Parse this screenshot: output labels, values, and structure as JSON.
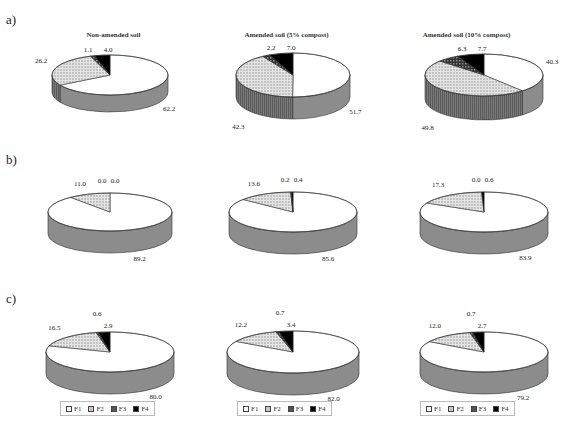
{
  "chart_data": {
    "type": "pie",
    "subtype": "3d-pie-grid",
    "legend": [
      "F1",
      "F2",
      "F3",
      "F4"
    ],
    "legend_position": "bottom (row c only)",
    "colors": {
      "F1": "#ffffff",
      "F2": "#c8c8c8",
      "F3": "#555555",
      "F4": "#000000",
      "side": "#8a8a8a"
    },
    "rows": [
      {
        "label": "a)",
        "charts": [
          {
            "title": "Non-amended soil",
            "values": {
              "F1": 62.2,
              "F2": 26.2,
              "F3": 1.1,
              "F4": 4.0
            }
          },
          {
            "title": "Amended soil (5% compost)",
            "values": {
              "F1": 51.7,
              "F2": 42.3,
              "F3": 2.2,
              "F4": 7.0
            }
          },
          {
            "title": "Amended soil (10% compost)",
            "values": {
              "F1": 40.3,
              "F2": 49.8,
              "F3": 6.3,
              "F4": 7.7
            }
          }
        ]
      },
      {
        "label": "b)",
        "charts": [
          {
            "title": "",
            "values": {
              "F1": 89.2,
              "F2": 11.0,
              "F3": 0.0,
              "F4": 0.0
            }
          },
          {
            "title": "",
            "values": {
              "F1": 85.6,
              "F2": 13.6,
              "F3": 0.2,
              "F4": 0.4
            }
          },
          {
            "title": "",
            "values": {
              "F1": 83.9,
              "F2": 17.3,
              "F3": 0.0,
              "F4": 0.6
            }
          }
        ]
      },
      {
        "label": "c)",
        "charts": [
          {
            "title": "",
            "values": {
              "F1": 80.0,
              "F2": 16.5,
              "F3": 0.6,
              "F4": 2.9
            }
          },
          {
            "title": "",
            "values": {
              "F1": 82.0,
              "F2": 12.2,
              "F3": 0.7,
              "F4": 3.4
            }
          },
          {
            "title": "",
            "values": {
              "F1": 79.2,
              "F2": 12.0,
              "F3": 0.7,
              "F4": 2.7
            }
          }
        ]
      }
    ]
  },
  "labels": {
    "row_a": "a)",
    "row_b": "b)",
    "row_c": "c)",
    "title_a1": "Non-amended soil",
    "title_a2": "Amended soil (5% compost)",
    "title_a3": "Amended soil (10% compost)",
    "legend": [
      "F1",
      "F2",
      "F3",
      "F4"
    ]
  }
}
